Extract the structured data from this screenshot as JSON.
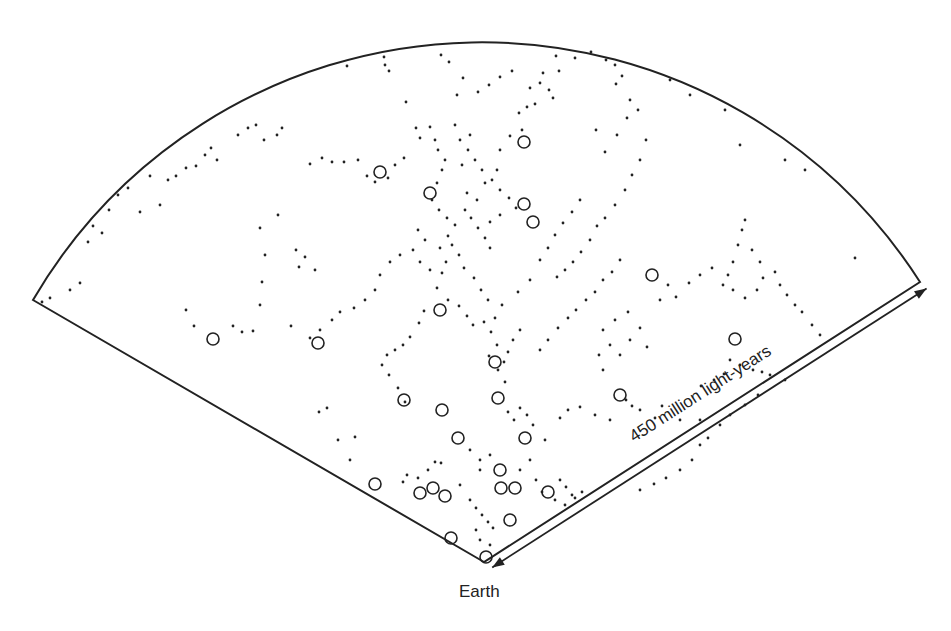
{
  "diagram": {
    "type": "galaxy-redshift-survey-wedge",
    "colors": {
      "ink": "#222222",
      "background": "#ffffff"
    },
    "geometry": {
      "apex": [
        484,
        562
      ],
      "left_corner": [
        33,
        300
      ],
      "right_corner": [
        920,
        282
      ],
      "radius": 520
    },
    "labels": {
      "earth": "Earth",
      "distance": "450 million light-years"
    },
    "circles": [
      [
        380,
        172
      ],
      [
        430,
        193
      ],
      [
        524,
        142
      ],
      [
        524,
        204
      ],
      [
        533,
        222
      ],
      [
        652,
        275
      ],
      [
        440,
        310
      ],
      [
        213,
        339
      ],
      [
        318,
        343
      ],
      [
        735,
        339
      ],
      [
        620,
        395
      ],
      [
        404,
        400
      ],
      [
        442,
        410
      ],
      [
        498,
        398
      ],
      [
        495,
        362
      ],
      [
        458,
        438
      ],
      [
        525,
        438
      ],
      [
        375,
        484
      ],
      [
        433,
        488
      ],
      [
        420,
        493
      ],
      [
        445,
        496
      ],
      [
        500,
        470
      ],
      [
        501,
        488
      ],
      [
        515,
        488
      ],
      [
        548,
        492
      ],
      [
        510,
        520
      ],
      [
        451,
        538
      ],
      [
        486,
        557
      ]
    ],
    "dots": [
      [
        384,
        57
      ],
      [
        385,
        65
      ],
      [
        389,
        71
      ],
      [
        347,
        66
      ],
      [
        406,
        102
      ],
      [
        441,
        55
      ],
      [
        449,
        62
      ],
      [
        457,
        95
      ],
      [
        463,
        78
      ],
      [
        478,
        92
      ],
      [
        489,
        85
      ],
      [
        500,
        77
      ],
      [
        512,
        71
      ],
      [
        530,
        88
      ],
      [
        540,
        83
      ],
      [
        549,
        90
      ],
      [
        553,
        98
      ],
      [
        559,
        71
      ],
      [
        575,
        58
      ],
      [
        591,
        52
      ],
      [
        606,
        60
      ],
      [
        615,
        65
      ],
      [
        616,
        84
      ],
      [
        622,
        76
      ],
      [
        630,
        100
      ],
      [
        638,
        110
      ],
      [
        627,
        118
      ],
      [
        617,
        135
      ],
      [
        605,
        152
      ],
      [
        596,
        130
      ],
      [
        556,
        56
      ],
      [
        543,
        73
      ],
      [
        535,
        104
      ],
      [
        527,
        107
      ],
      [
        519,
        113
      ],
      [
        522,
        130
      ],
      [
        510,
        136
      ],
      [
        500,
        150
      ],
      [
        497,
        170
      ],
      [
        485,
        183
      ],
      [
        477,
        200
      ],
      [
        467,
        193
      ],
      [
        462,
        165
      ],
      [
        470,
        135
      ],
      [
        455,
        125
      ],
      [
        445,
        160
      ],
      [
        430,
        127
      ],
      [
        435,
        140
      ],
      [
        438,
        150
      ],
      [
        442,
        170
      ],
      [
        437,
        183
      ],
      [
        432,
        200
      ],
      [
        439,
        210
      ],
      [
        447,
        218
      ],
      [
        455,
        225
      ],
      [
        448,
        236
      ],
      [
        440,
        248
      ],
      [
        446,
        262
      ],
      [
        442,
        273
      ],
      [
        437,
        288
      ],
      [
        448,
        300
      ],
      [
        459,
        306
      ],
      [
        467,
        316
      ],
      [
        473,
        325
      ],
      [
        484,
        322
      ],
      [
        491,
        332
      ],
      [
        497,
        345
      ],
      [
        489,
        356
      ],
      [
        498,
        370
      ],
      [
        505,
        382
      ],
      [
        424,
        311
      ],
      [
        419,
        323
      ],
      [
        410,
        337
      ],
      [
        403,
        345
      ],
      [
        395,
        350
      ],
      [
        387,
        355
      ],
      [
        382,
        365
      ],
      [
        389,
        375
      ],
      [
        398,
        388
      ],
      [
        405,
        402
      ],
      [
        416,
        128
      ],
      [
        420,
        138
      ],
      [
        404,
        158
      ],
      [
        395,
        165
      ],
      [
        388,
        178
      ],
      [
        375,
        182
      ],
      [
        367,
        176
      ],
      [
        358,
        160
      ],
      [
        344,
        162
      ],
      [
        332,
        162
      ],
      [
        322,
        158
      ],
      [
        310,
        164
      ],
      [
        296,
        250
      ],
      [
        305,
        257
      ],
      [
        299,
        267
      ],
      [
        315,
        270
      ],
      [
        262,
        282
      ],
      [
        265,
        255
      ],
      [
        260,
        228
      ],
      [
        278,
        215
      ],
      [
        264,
        140
      ],
      [
        277,
        135
      ],
      [
        282,
        128
      ],
      [
        256,
        125
      ],
      [
        248,
        128
      ],
      [
        238,
        135
      ],
      [
        217,
        160
      ],
      [
        211,
        148
      ],
      [
        205,
        155
      ],
      [
        196,
        166
      ],
      [
        186,
        168
      ],
      [
        176,
        176
      ],
      [
        168,
        180
      ],
      [
        150,
        176
      ],
      [
        160,
        205
      ],
      [
        140,
        212
      ],
      [
        128,
        188
      ],
      [
        118,
        195
      ],
      [
        109,
        210
      ],
      [
        102,
        233
      ],
      [
        93,
        226
      ],
      [
        88,
        242
      ],
      [
        80,
        283
      ],
      [
        70,
        290
      ],
      [
        50,
        298
      ],
      [
        42,
        302
      ],
      [
        186,
        310
      ],
      [
        194,
        326
      ],
      [
        233,
        326
      ],
      [
        242,
        332
      ],
      [
        253,
        331
      ],
      [
        260,
        305
      ],
      [
        291,
        326
      ],
      [
        319,
        412
      ],
      [
        327,
        408
      ],
      [
        338,
        440
      ],
      [
        350,
        460
      ],
      [
        355,
        437
      ],
      [
        407,
        475
      ],
      [
        403,
        482
      ],
      [
        418,
        478
      ],
      [
        428,
        470
      ],
      [
        435,
        462
      ],
      [
        441,
        463
      ],
      [
        460,
        485
      ],
      [
        480,
        460
      ],
      [
        480,
        470
      ],
      [
        470,
        450
      ],
      [
        490,
        455
      ],
      [
        520,
        470
      ],
      [
        530,
        460
      ],
      [
        560,
        480
      ],
      [
        566,
        487
      ],
      [
        572,
        495
      ],
      [
        545,
        440
      ],
      [
        533,
        425
      ],
      [
        527,
        415
      ],
      [
        520,
        408
      ],
      [
        560,
        418
      ],
      [
        568,
        410
      ],
      [
        580,
        407
      ],
      [
        595,
        415
      ],
      [
        610,
        420
      ],
      [
        626,
        400
      ],
      [
        632,
        406
      ],
      [
        640,
        410
      ],
      [
        655,
        418
      ],
      [
        662,
        406
      ],
      [
        680,
        420
      ],
      [
        700,
        420
      ],
      [
        701,
        386
      ],
      [
        714,
        380
      ],
      [
        724,
        374
      ],
      [
        730,
        360
      ],
      [
        740,
        365
      ],
      [
        753,
        370
      ],
      [
        762,
        372
      ],
      [
        770,
        375
      ],
      [
        785,
        380
      ],
      [
        758,
        395
      ],
      [
        745,
        405
      ],
      [
        730,
        415
      ],
      [
        720,
        425
      ],
      [
        708,
        438
      ],
      [
        700,
        445
      ],
      [
        692,
        460
      ],
      [
        680,
        470
      ],
      [
        666,
        478
      ],
      [
        654,
        484
      ],
      [
        640,
        490
      ],
      [
        603,
        330
      ],
      [
        615,
        320
      ],
      [
        628,
        312
      ],
      [
        640,
        328
      ],
      [
        610,
        345
      ],
      [
        599,
        355
      ],
      [
        603,
        370
      ],
      [
        620,
        355
      ],
      [
        630,
        340
      ],
      [
        647,
        347
      ],
      [
        660,
        300
      ],
      [
        668,
        285
      ],
      [
        676,
        297
      ],
      [
        689,
        283
      ],
      [
        700,
        275
      ],
      [
        712,
        268
      ],
      [
        723,
        285
      ],
      [
        733,
        290
      ],
      [
        745,
        298
      ],
      [
        757,
        290
      ],
      [
        763,
        278
      ],
      [
        775,
        272
      ],
      [
        780,
        285
      ],
      [
        787,
        295
      ],
      [
        795,
        305
      ],
      [
        802,
        312
      ],
      [
        812,
        325
      ],
      [
        820,
        335
      ],
      [
        745,
        220
      ],
      [
        742,
        230
      ],
      [
        738,
        245
      ],
      [
        752,
        250
      ],
      [
        760,
        262
      ],
      [
        733,
        262
      ],
      [
        728,
        275
      ],
      [
        855,
        258
      ],
      [
        740,
        145
      ],
      [
        785,
        160
      ],
      [
        805,
        170
      ],
      [
        725,
        110
      ],
      [
        690,
        95
      ],
      [
        670,
        80
      ],
      [
        646,
        140
      ],
      [
        640,
        160
      ],
      [
        632,
        175
      ],
      [
        625,
        190
      ],
      [
        615,
        205
      ],
      [
        605,
        218
      ],
      [
        597,
        226
      ],
      [
        590,
        240
      ],
      [
        581,
        252
      ],
      [
        573,
        262
      ],
      [
        565,
        270
      ],
      [
        557,
        277
      ],
      [
        580,
        200
      ],
      [
        572,
        212
      ],
      [
        563,
        223
      ],
      [
        555,
        235
      ],
      [
        548,
        248
      ],
      [
        540,
        260
      ],
      [
        530,
        280
      ],
      [
        518,
        292
      ],
      [
        502,
        305
      ],
      [
        495,
        318
      ],
      [
        488,
        300
      ],
      [
        481,
        290
      ],
      [
        474,
        278
      ],
      [
        464,
        268
      ],
      [
        459,
        255
      ],
      [
        452,
        245
      ],
      [
        400,
        255
      ],
      [
        390,
        262
      ],
      [
        380,
        275
      ],
      [
        375,
        290
      ],
      [
        365,
        300
      ],
      [
        354,
        308
      ],
      [
        340,
        312
      ],
      [
        332,
        320
      ],
      [
        320,
        330
      ],
      [
        310,
        338
      ],
      [
        620,
        260
      ],
      [
        612,
        272
      ],
      [
        603,
        280
      ],
      [
        595,
        292
      ],
      [
        586,
        300
      ],
      [
        576,
        310
      ],
      [
        568,
        318
      ],
      [
        558,
        328
      ],
      [
        548,
        340
      ],
      [
        540,
        350
      ],
      [
        520,
        330
      ],
      [
        513,
        340
      ],
      [
        508,
        352
      ],
      [
        504,
        362
      ],
      [
        508,
        412
      ],
      [
        514,
        420
      ],
      [
        536,
        480
      ],
      [
        542,
        492
      ],
      [
        555,
        500
      ],
      [
        565,
        505
      ],
      [
        575,
        498
      ],
      [
        582,
        492
      ],
      [
        470,
        500
      ],
      [
        476,
        508
      ],
      [
        482,
        515
      ],
      [
        488,
        522
      ],
      [
        493,
        528
      ],
      [
        476,
        530
      ],
      [
        480,
        540
      ],
      [
        490,
        545
      ],
      [
        465,
        210
      ],
      [
        471,
        218
      ],
      [
        478,
        228
      ],
      [
        485,
        238
      ],
      [
        490,
        248
      ],
      [
        418,
        230
      ],
      [
        425,
        240
      ],
      [
        413,
        250
      ],
      [
        420,
        262
      ],
      [
        430,
        270
      ],
      [
        460,
        140
      ],
      [
        468,
        150
      ],
      [
        475,
        160
      ],
      [
        482,
        170
      ],
      [
        492,
        180
      ],
      [
        500,
        190
      ],
      [
        509,
        198
      ],
      [
        516,
        208
      ],
      [
        500,
        215
      ],
      [
        490,
        222
      ]
    ]
  }
}
